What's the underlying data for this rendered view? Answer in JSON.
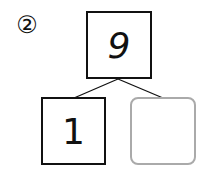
{
  "problem": {
    "number_label": "②"
  },
  "number_bond": {
    "whole": "9",
    "part_left": "1",
    "part_right": ""
  },
  "colors": {
    "box_border": "#111111",
    "blank_box_border": "#aaaaaa"
  }
}
